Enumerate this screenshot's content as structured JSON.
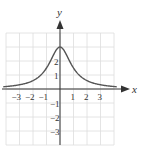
{
  "chart_data": {
    "type": "line",
    "title": "",
    "xlabel": "x",
    "ylabel": "y",
    "xlim": [
      -4,
      4
    ],
    "ylim": [
      -4,
      4
    ],
    "grid": true,
    "x_ticks": [
      -3,
      -2,
      -1,
      1,
      2,
      3
    ],
    "y_ticks": [
      -3,
      -2,
      -1,
      1,
      2
    ],
    "x_tick_labels": [
      "−3",
      "−2",
      "−1",
      "1",
      "2",
      "3"
    ],
    "y_tick_labels": [
      "−3",
      "−2",
      "−1",
      "1",
      "2"
    ],
    "series": [
      {
        "name": "f(x) = 3/(1+x²)",
        "x": [
          -4,
          -3,
          -2,
          -1.5,
          -1,
          -0.5,
          0,
          0.5,
          1,
          1.5,
          2,
          3,
          4
        ],
        "y": [
          0.18,
          0.3,
          0.6,
          0.92,
          1.5,
          2.4,
          3,
          2.4,
          1.5,
          0.92,
          0.6,
          0.3,
          0.18
        ]
      }
    ],
    "curve_color": "#555555",
    "grid_color": "#dddddd"
  }
}
